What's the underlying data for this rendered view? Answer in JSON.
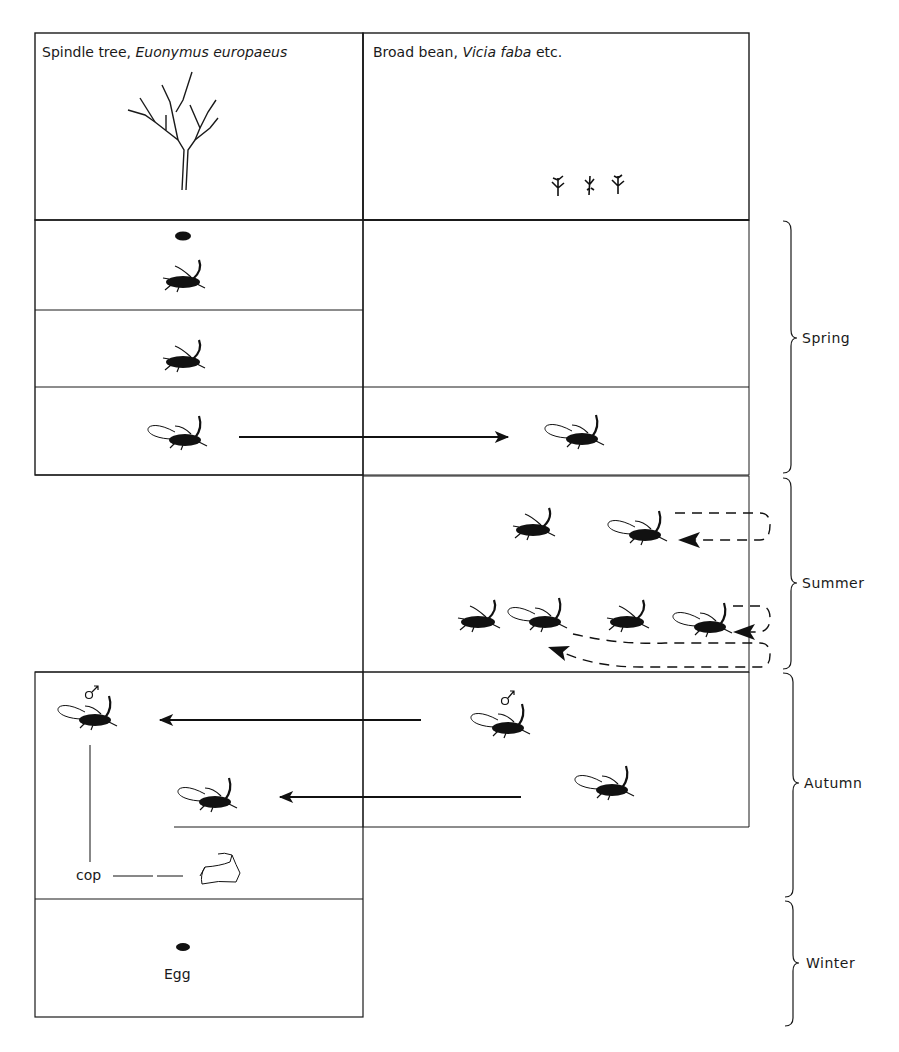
{
  "hosts": {
    "primary": {
      "common": "Spindle tree,",
      "latin": "Euonymus europaeus"
    },
    "secondary": {
      "common": "Broad bean,",
      "latin": "Vicia faba",
      "suffix": "etc."
    }
  },
  "seasons": [
    "Spring",
    "Summer",
    "Autumn",
    "Winter"
  ],
  "labels": {
    "cop": "cop",
    "egg": "Egg",
    "male_symbol": "♂"
  },
  "colors": {
    "line": "#1a1a1a",
    "background": "#ffffff"
  }
}
